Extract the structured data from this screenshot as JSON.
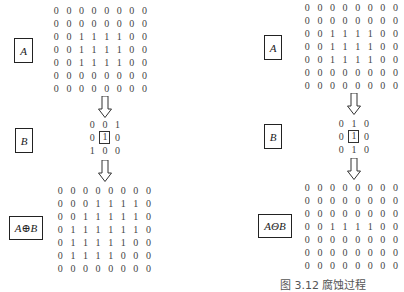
{
  "panels": [
    {
      "id": "dilation",
      "input_label": "A",
      "structuring_label": "B",
      "result_label": "A⊕B",
      "A": [
        [
          0,
          0,
          0,
          0,
          0,
          0,
          0,
          0
        ],
        [
          0,
          0,
          0,
          0,
          0,
          0,
          0,
          0
        ],
        [
          0,
          0,
          1,
          1,
          1,
          1,
          0,
          0
        ],
        [
          0,
          0,
          1,
          1,
          1,
          1,
          0,
          0
        ],
        [
          0,
          0,
          1,
          1,
          1,
          1,
          0,
          0
        ],
        [
          0,
          0,
          0,
          0,
          0,
          0,
          0,
          0
        ],
        [
          0,
          0,
          0,
          0,
          0,
          0,
          0,
          0
        ]
      ],
      "B": [
        [
          0,
          0,
          1
        ],
        [
          0,
          1,
          0
        ],
        [
          1,
          0,
          0
        ]
      ],
      "B_origin": [
        1,
        1
      ],
      "result": [
        [
          0,
          0,
          0,
          0,
          0,
          0,
          0,
          0
        ],
        [
          0,
          0,
          0,
          1,
          1,
          1,
          1,
          0
        ],
        [
          0,
          0,
          1,
          1,
          1,
          1,
          1,
          0
        ],
        [
          0,
          1,
          1,
          1,
          1,
          1,
          1,
          0
        ],
        [
          0,
          1,
          1,
          1,
          1,
          1,
          0,
          0
        ],
        [
          0,
          1,
          1,
          1,
          1,
          0,
          0,
          0
        ],
        [
          0,
          0,
          0,
          0,
          0,
          0,
          0,
          0
        ]
      ],
      "caption": ""
    },
    {
      "id": "erosion",
      "input_label": "A",
      "structuring_label": "B",
      "result_label": "AΘB",
      "A": [
        [
          0,
          0,
          0,
          0,
          0,
          0,
          0,
          0
        ],
        [
          0,
          0,
          0,
          0,
          0,
          0,
          0,
          0
        ],
        [
          0,
          0,
          1,
          1,
          1,
          1,
          0,
          0
        ],
        [
          0,
          0,
          1,
          1,
          1,
          1,
          0,
          0
        ],
        [
          0,
          0,
          1,
          1,
          1,
          1,
          0,
          0
        ],
        [
          0,
          0,
          0,
          0,
          0,
          0,
          0,
          0
        ],
        [
          0,
          0,
          0,
          0,
          0,
          0,
          0,
          0
        ]
      ],
      "B": [
        [
          0,
          1,
          0
        ],
        [
          0,
          1,
          0
        ],
        [
          0,
          1,
          0
        ]
      ],
      "B_origin": [
        1,
        1
      ],
      "result": [
        [
          0,
          0,
          0,
          0,
          0,
          0,
          0,
          0
        ],
        [
          0,
          0,
          0,
          0,
          0,
          0,
          0,
          0
        ],
        [
          0,
          0,
          0,
          0,
          0,
          0,
          0,
          0
        ],
        [
          0,
          0,
          1,
          1,
          1,
          1,
          0,
          0
        ],
        [
          0,
          0,
          0,
          0,
          0,
          0,
          0,
          0
        ],
        [
          0,
          0,
          0,
          0,
          0,
          0,
          0,
          0
        ],
        [
          0,
          0,
          0,
          0,
          0,
          0,
          0,
          0
        ]
      ],
      "caption": "图 3.12  腐蚀过程"
    }
  ],
  "colors": {
    "text": "#444444",
    "border": "#222222",
    "background": "#ffffff"
  }
}
